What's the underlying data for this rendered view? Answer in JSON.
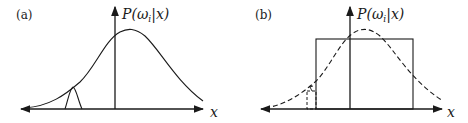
{
  "panels": [
    {
      "label": "(a)",
      "y_axis_label": "P(ω",
      "y_sub": "i",
      "y_rest": "|x)",
      "x_axis_label": "x"
    },
    {
      "label": "(b)",
      "y_axis_label": "P(ω",
      "y_sub": "i",
      "y_rest": "|x)",
      "x_axis_label": "x"
    }
  ]
}
